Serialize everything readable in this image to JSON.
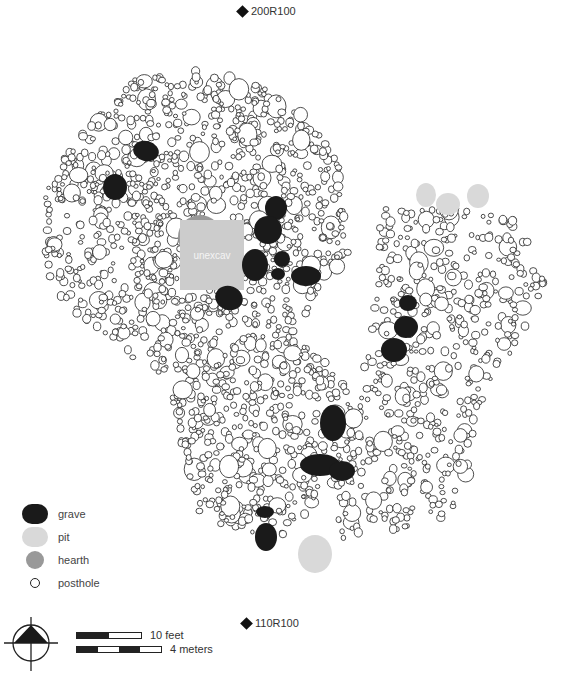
{
  "datums": {
    "north": {
      "label": "200R100",
      "x": 238,
      "y": 11
    },
    "south": {
      "label": "110R100",
      "x": 242,
      "y": 622
    }
  },
  "unexcavated": {
    "label": "unexcav",
    "x": 180,
    "y": 220,
    "w": 64,
    "h": 70,
    "color": "#cccccc"
  },
  "colors": {
    "grave": "#1a1a1a",
    "pit": "#d9d9d9",
    "hearth": "#999999",
    "posthole_stroke": "#222222"
  },
  "legend": {
    "items": [
      {
        "key": "grave",
        "label": "grave"
      },
      {
        "key": "pit",
        "label": "pit"
      },
      {
        "key": "hearth",
        "label": "hearth"
      },
      {
        "key": "posthole",
        "label": "posthole"
      }
    ]
  },
  "scale": {
    "feet_label": "10 feet",
    "meters_label": "4 meters"
  },
  "features": {
    "hearths": [
      {
        "cx": 200,
        "cy": 237,
        "r": 22
      }
    ],
    "pits": [
      {
        "cx": 426,
        "cy": 195,
        "rx": 10,
        "ry": 12
      },
      {
        "cx": 448,
        "cy": 204,
        "rx": 12,
        "ry": 11
      },
      {
        "cx": 478,
        "cy": 196,
        "rx": 11,
        "ry": 12
      },
      {
        "cx": 315,
        "cy": 554,
        "rx": 17,
        "ry": 19
      }
    ],
    "graves": [
      {
        "cx": 146,
        "cy": 151,
        "rx": 13,
        "ry": 10,
        "rot": 15
      },
      {
        "cx": 115,
        "cy": 187,
        "rx": 12,
        "ry": 13,
        "rot": 0
      },
      {
        "cx": 276,
        "cy": 208,
        "rx": 11,
        "ry": 12,
        "rot": 0
      },
      {
        "cx": 268,
        "cy": 230,
        "rx": 14,
        "ry": 14,
        "rot": 0
      },
      {
        "cx": 255,
        "cy": 265,
        "rx": 13,
        "ry": 16,
        "rot": 0
      },
      {
        "cx": 282,
        "cy": 259,
        "rx": 8,
        "ry": 8,
        "rot": 0
      },
      {
        "cx": 278,
        "cy": 274,
        "rx": 7,
        "ry": 6,
        "rot": 0
      },
      {
        "cx": 306,
        "cy": 276,
        "rx": 15,
        "ry": 10,
        "rot": 0
      },
      {
        "cx": 229,
        "cy": 298,
        "rx": 14,
        "ry": 12,
        "rot": 20
      },
      {
        "cx": 408,
        "cy": 303,
        "rx": 9,
        "ry": 8,
        "rot": 0
      },
      {
        "cx": 406,
        "cy": 327,
        "rx": 12,
        "ry": 11,
        "rot": 0
      },
      {
        "cx": 394,
        "cy": 350,
        "rx": 13,
        "ry": 12,
        "rot": 0
      },
      {
        "cx": 333,
        "cy": 423,
        "rx": 13,
        "ry": 18,
        "rot": 0
      },
      {
        "cx": 320,
        "cy": 465,
        "rx": 20,
        "ry": 11,
        "rot": 0
      },
      {
        "cx": 342,
        "cy": 471,
        "rx": 13,
        "ry": 10,
        "rot": 0
      },
      {
        "cx": 265,
        "cy": 512,
        "rx": 9,
        "ry": 6,
        "rot": 0
      },
      {
        "cx": 266,
        "cy": 537,
        "rx": 11,
        "ry": 14,
        "rot": 0
      }
    ]
  }
}
